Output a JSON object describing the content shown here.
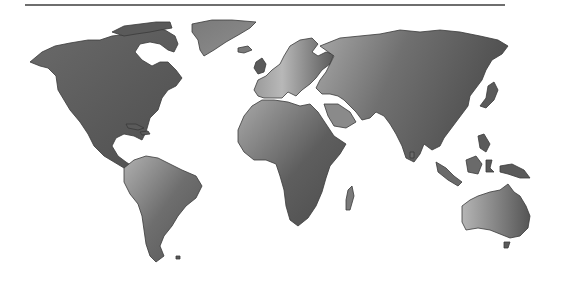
{
  "map": {
    "title": "World map",
    "style": "grayscale gradient continents on white background",
    "colors": {
      "background": "#ffffff",
      "rule": "#6e6e6e",
      "land_dark": "#4a4a4a",
      "land_mid": "#7a7a7a",
      "land_light": "#b8b8b8",
      "outline": "#3a3a3a"
    },
    "regions": [
      {
        "name": "North America"
      },
      {
        "name": "Greenland"
      },
      {
        "name": "South America"
      },
      {
        "name": "Europe"
      },
      {
        "name": "Africa"
      },
      {
        "name": "Asia"
      },
      {
        "name": "Australia"
      },
      {
        "name": "Madagascar"
      },
      {
        "name": "Japan"
      },
      {
        "name": "Indonesia"
      },
      {
        "name": "New Guinea"
      },
      {
        "name": "United Kingdom"
      },
      {
        "name": "Iceland"
      },
      {
        "name": "Caribbean"
      }
    ]
  }
}
